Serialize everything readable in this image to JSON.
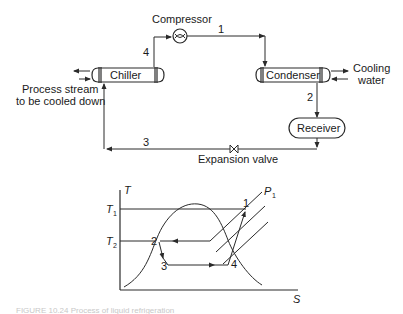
{
  "process_flow": {
    "compressor_label": "Compressor",
    "chiller_label": "Chiller",
    "condenser_label": "Condenser",
    "receiver_label": "Receiver",
    "expansion_valve_label": "Expansion valve",
    "cooling_water_label_line1": "Cooling",
    "cooling_water_label_line2": "water",
    "process_stream_label_line1": "Process stream",
    "process_stream_label_line2": "to be cooled down",
    "stream_labels": {
      "s1": "1",
      "s2": "2",
      "s3": "3",
      "s4": "4"
    }
  },
  "ts_diagram": {
    "y_axis_label": "T",
    "x_axis_label": "S",
    "t1_label": "T",
    "t1_sub": "1",
    "t2_label": "T",
    "t2_sub": "2",
    "pressure_label": "P",
    "pressure_sub": "1",
    "point_labels": {
      "p1": "1",
      "p2": "2",
      "p3": "3",
      "p4": "4"
    }
  },
  "caption": {
    "text": "FIGURE 10.24  Process of liquid refrigeration"
  }
}
